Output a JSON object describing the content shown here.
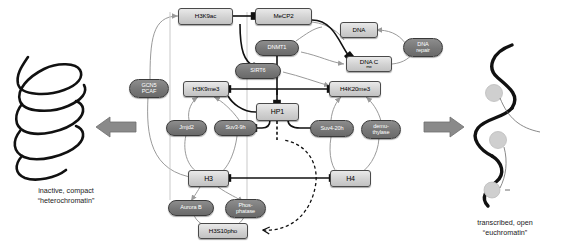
{
  "diagram": {
    "title_left": "inactive, compact\n\"heterochromatin\"",
    "left_caption_line1": "inactive, compact",
    "left_caption_line2": "“heterochromatin”",
    "right_caption_line1": "transcribed, open",
    "right_caption_line2": "“euchromatin”",
    "colors": {
      "rect_fill": "#d2d2d2",
      "pill_fill": "#777777",
      "node_stroke": "#4a4a4a",
      "edge_dark": "#111111",
      "edge_gray": "#9a9a9a",
      "arrow_block": "#8a8a8a",
      "nucleosome": "#cfcfcf",
      "background": "#ffffff"
    }
  },
  "nodes": {
    "h3k9ac": {
      "label": "H3K9ac",
      "type": "rect"
    },
    "mecp2": {
      "label": "MeCP2",
      "type": "rect"
    },
    "dna": {
      "label": "DNA",
      "type": "rect"
    },
    "dna_repair": {
      "label": "DNA\nrepair",
      "line1": "DNA",
      "line2": "repair",
      "type": "pill"
    },
    "dnmt1": {
      "label": "DNMT1",
      "type": "pill"
    },
    "sirt6": {
      "label": "SIRT6",
      "type": "pill"
    },
    "dna_cme": {
      "label": "DNA C",
      "sup": "me",
      "type": "rect"
    },
    "gcn5_pcaf": {
      "label": "GCN5\nPCAF",
      "line1": "GCN5",
      "line2": "PCAF",
      "type": "pill"
    },
    "h3k9me3": {
      "label": "H3K9me3",
      "type": "rect"
    },
    "hp1": {
      "label": "HP1",
      "type": "rect"
    },
    "h4k20me3": {
      "label": "H4K20me3",
      "type": "rect"
    },
    "jmjd2": {
      "label": "Jmjd2",
      "type": "pill"
    },
    "suv39h": {
      "label": "Suv3-9h",
      "type": "pill"
    },
    "suv420h": {
      "label": "Suv4-20h",
      "type": "pill"
    },
    "demethylase": {
      "label": "demethylase",
      "line1": "demu-",
      "line2": "thylase",
      "type": "pill"
    },
    "h3": {
      "label": "H3",
      "type": "rect"
    },
    "h4": {
      "label": "H4",
      "type": "rect"
    },
    "aurora_b": {
      "label": "Aurora B",
      "type": "pill"
    },
    "phosphatase": {
      "label": "Phosphatase",
      "line1": "Phos-",
      "line2": "phatase",
      "type": "pill"
    },
    "h3s10pho": {
      "label": "H3S10pho",
      "type": "rect"
    }
  },
  "icons": {
    "left_arrow": "left-block-arrow",
    "right_arrow": "right-block-arrow",
    "coil": "condensed-chromatin-coil",
    "open_strand": "open-chromatin-strand"
  }
}
